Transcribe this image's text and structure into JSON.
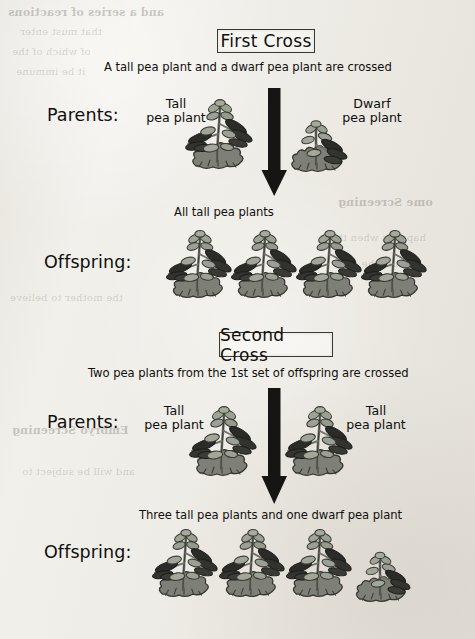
{
  "figure": {
    "kind": "genetics-cross-diagram"
  },
  "colors": {
    "paper": "#eceae4",
    "ink": "#100f0d",
    "box_border": "#3a3833",
    "arrow": "#161513",
    "leaf_light": "#9a9e92",
    "leaf_dark": "#2b2b28",
    "base_bush": "#7e8078",
    "outline": "#3c3c37"
  },
  "sections": [
    {
      "id": "first-cross",
      "heading": "First Cross",
      "caption": "A tall pea plant and a dwarf pea plant are crossed",
      "parents_label": "Parents:",
      "parents": [
        {
          "name": "Tall\npea plant",
          "type": "tall"
        },
        {
          "name": "Dwarf\npea plant",
          "type": "dwarf"
        }
      ],
      "result_caption": "All tall pea plants",
      "offspring_label": "Offspring:",
      "offspring": [
        "tall",
        "tall",
        "tall",
        "tall"
      ]
    },
    {
      "id": "second-cross",
      "heading": "Second Cross",
      "caption": "Two pea plants from the 1st set of offspring are crossed",
      "parents_label": "Parents:",
      "parents": [
        {
          "name": "Tall\npea plant",
          "type": "tall"
        },
        {
          "name": "Tall\npea plant",
          "type": "tall"
        }
      ],
      "result_caption": "Three tall pea plants and one dwarf pea plant",
      "offspring_label": "Offspring:",
      "offspring": [
        "tall",
        "tall",
        "tall",
        "dwarf"
      ]
    }
  ],
  "arrows": [
    {
      "id": "first-cross-arrow",
      "direction": "down"
    },
    {
      "id": "second-cross-arrow",
      "direction": "down"
    }
  ],
  "background_showthrough": [
    "and a series of reactions",
    "that must enter",
    "of which of the",
    "it be immune",
    "ome Screening",
    "happens when the",
    "should the cells",
    "the mother to believe",
    "Embryo Screening",
    "and will be subject to"
  ]
}
